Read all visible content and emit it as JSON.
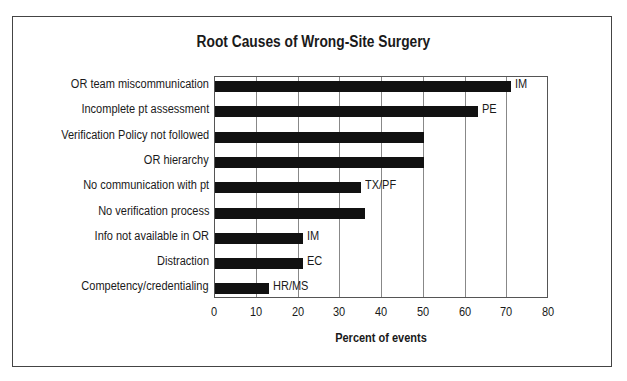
{
  "chart_data": {
    "type": "bar",
    "orientation": "horizontal",
    "title": "Root Causes of Wrong-Site Surgery",
    "xlabel": "Percent of events",
    "ylabel": "",
    "xlim": [
      0,
      80
    ],
    "xticks": [
      0,
      10,
      20,
      30,
      40,
      50,
      60,
      70,
      80
    ],
    "grid": true,
    "categories": [
      "OR team miscommunication",
      "Incomplete pt assessment",
      "Verification Policy not followed",
      "OR hierarchy",
      "No communication with pt",
      "No verification process",
      "Info not available in OR",
      "Distraction",
      "Competency/credentialing"
    ],
    "values": [
      71,
      63,
      50,
      50,
      35,
      36,
      21,
      21,
      13
    ],
    "annotations": [
      "IM",
      "PE",
      "",
      "",
      "TX/PF",
      "",
      "IM",
      "EC",
      "HR/MS"
    ],
    "bar_color": "#111111"
  }
}
